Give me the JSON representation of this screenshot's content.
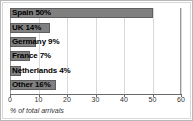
{
  "chart_data": {
    "type": "bar",
    "orientation": "horizontal",
    "title": "",
    "xlabel": "% of total arrivals",
    "ylabel": "",
    "categories": [
      "Spain",
      "UK",
      "Germany",
      "France",
      "Netherlands",
      "Other"
    ],
    "values": [
      50,
      14,
      9,
      7,
      4,
      16
    ],
    "bar_labels": [
      "Spain 50%",
      "UK 14%",
      "Germany 9%",
      "France 7%",
      "Netherlands 4%",
      "Other 16%"
    ],
    "xlim": [
      0,
      60
    ],
    "xticks": [
      0,
      10,
      20,
      30,
      40,
      50,
      60
    ],
    "xticklabels": [
      "0",
      "10",
      "20",
      "30",
      "40",
      "50",
      "60"
    ],
    "grid": "vertical",
    "legend": "none",
    "colors": {
      "bar_fill": "#808080",
      "bar_border": "#5f5f5f",
      "plot_background": "#ffffff",
      "gridline": "#d9d9d9",
      "axis": "#6a6a6a",
      "label_text": "#000000",
      "frame_border": "#b8b8b8"
    }
  }
}
